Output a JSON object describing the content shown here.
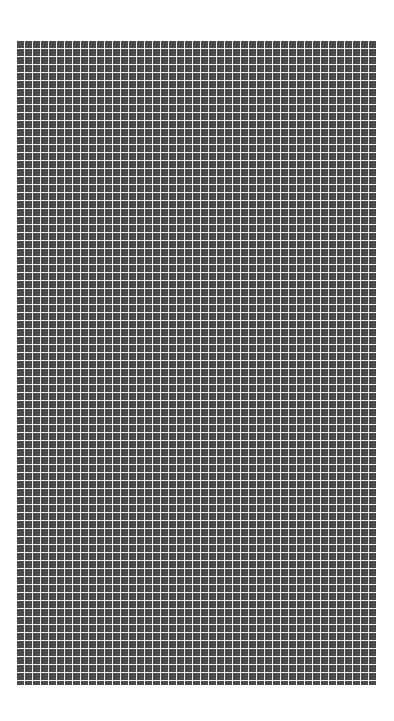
{
  "grid": {
    "columns": 45,
    "rows": 80,
    "cell_color": "#4b4b4b",
    "line_color": "#ffffff",
    "background": "#ffffff"
  }
}
